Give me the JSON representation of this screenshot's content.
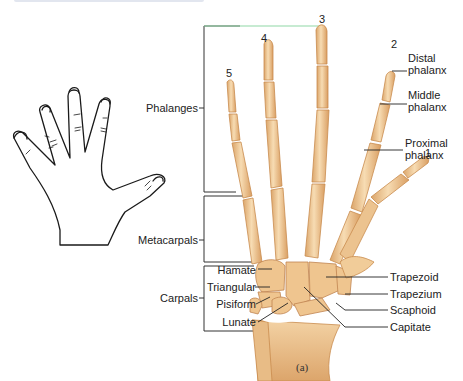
{
  "figure": {
    "caption": "(a)",
    "digit_numbers": [
      "1",
      "2",
      "3",
      "4",
      "5"
    ],
    "bracket_labels": {
      "phalanges": "Phalanges",
      "metacarpals": "Metacarpals",
      "carpals": "Carpals"
    },
    "phalanx_labels": {
      "distal": [
        "Distal",
        "phalanx"
      ],
      "middle": [
        "Middle",
        "phalanx"
      ],
      "proximal": [
        "Proximal",
        "phalanx"
      ]
    },
    "carpal_left_labels": [
      "Hamate",
      "Triangular",
      "Pisiform",
      "Lunate"
    ],
    "carpal_right_labels": [
      "Trapezoid",
      "Trapezium",
      "Scaphoid",
      "Capitate"
    ],
    "colors": {
      "bone_fill": "#f2cf9f",
      "bone_shade": "#dba56a",
      "bone_outline": "#c98c4e",
      "leader_line": "#333333",
      "bracket_accent": "#7fd39a"
    }
  }
}
